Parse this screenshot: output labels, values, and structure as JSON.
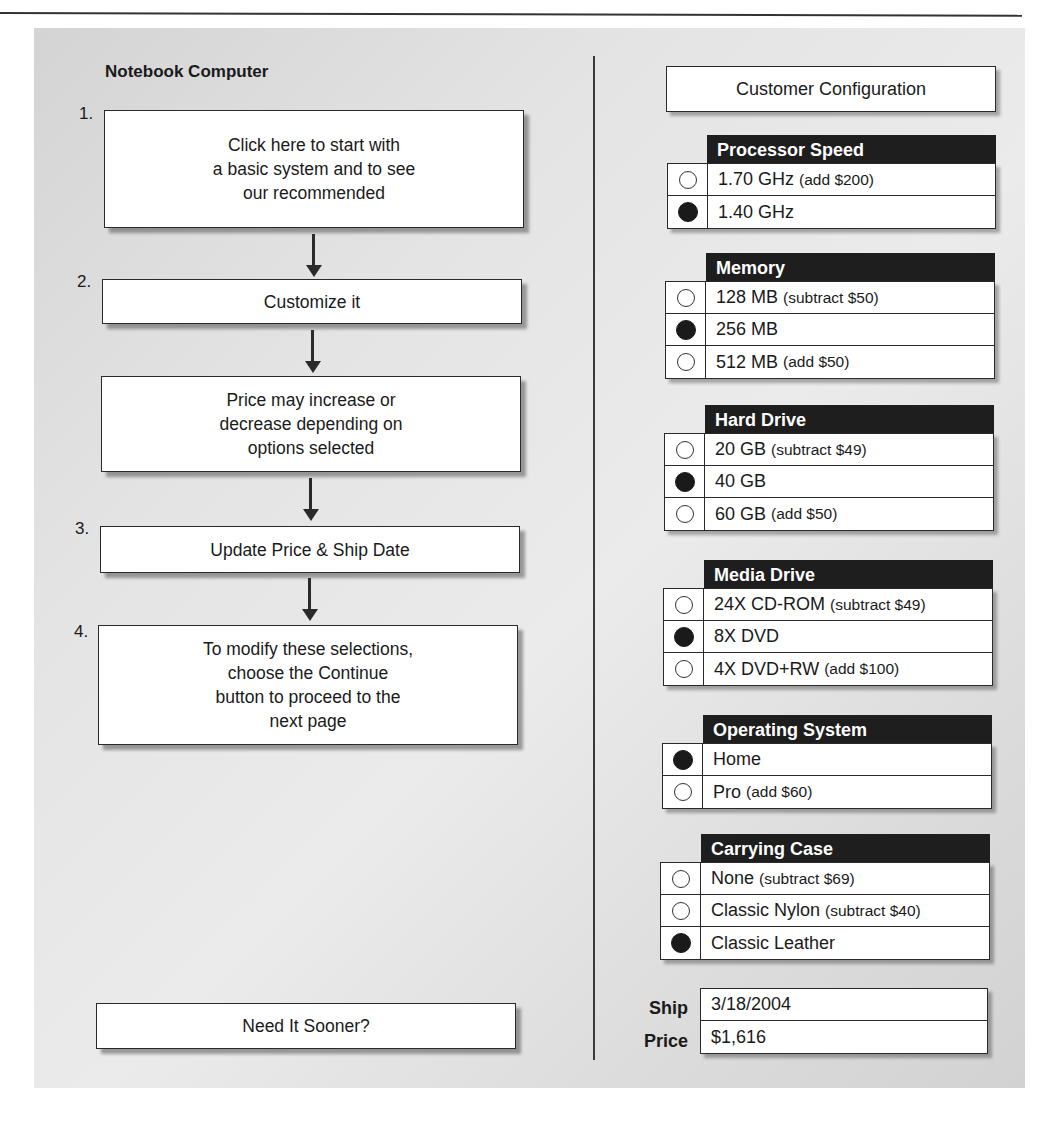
{
  "left": {
    "title": "Notebook Computer",
    "steps": [
      {
        "num": "1.",
        "text": "Click here to start with\na basic system and to see\nour recommended"
      },
      {
        "num": "2.",
        "text": "Customize it"
      },
      {
        "num": "",
        "text": "Price may increase or\ndecrease depending on\noptions selected"
      },
      {
        "num": "3.",
        "text": "Update Price & Ship Date"
      },
      {
        "num": "4.",
        "text": "To modify these selections,\nchoose the Continue\nbutton to proceed to the\nnext page"
      }
    ],
    "sooner_button": "Need It Sooner?"
  },
  "right": {
    "title": "Customer Configuration",
    "groups": [
      {
        "header": "Processor Speed",
        "options": [
          {
            "label": "1.70 GHz",
            "note": "(add $200)",
            "selected": false
          },
          {
            "label": "1.40 GHz",
            "note": "",
            "selected": true
          }
        ]
      },
      {
        "header": "Memory",
        "options": [
          {
            "label": "128 MB",
            "note": "(subtract $50)",
            "selected": false
          },
          {
            "label": "256 MB",
            "note": "",
            "selected": true
          },
          {
            "label": "512 MB",
            "note": "(add $50)",
            "selected": false
          }
        ]
      },
      {
        "header": "Hard Drive",
        "options": [
          {
            "label": "20 GB",
            "note": "(subtract $49)",
            "selected": false
          },
          {
            "label": "40 GB",
            "note": "",
            "selected": true
          },
          {
            "label": "60 GB",
            "note": "(add $50)",
            "selected": false
          }
        ]
      },
      {
        "header": "Media Drive",
        "options": [
          {
            "label": "24X CD-ROM",
            "note": "(subtract $49)",
            "selected": false
          },
          {
            "label": "8X DVD",
            "note": "",
            "selected": true
          },
          {
            "label": "4X DVD+RW",
            "note": "(add $100)",
            "selected": false
          }
        ]
      },
      {
        "header": "Operating System",
        "options": [
          {
            "label": "Home",
            "note": "",
            "selected": true
          },
          {
            "label": "Pro",
            "note": "(add $60)",
            "selected": false
          }
        ]
      },
      {
        "header": "Carrying Case",
        "options": [
          {
            "label": "None",
            "note": "(subtract $69)",
            "selected": false
          },
          {
            "label": "Classic Nylon",
            "note": "(subtract $40)",
            "selected": false
          },
          {
            "label": "Classic Leather",
            "note": "",
            "selected": true
          }
        ]
      }
    ],
    "summary": {
      "ship_label": "Ship",
      "ship_value": "3/18/2004",
      "price_label": "Price",
      "price_value": "$1,616"
    }
  }
}
